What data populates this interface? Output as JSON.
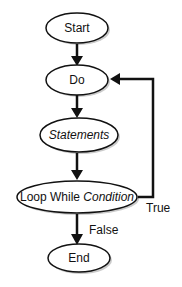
{
  "diagram": {
    "type": "flowchart",
    "nodes": [
      {
        "id": "start",
        "label": "Start",
        "shape": "ellipse"
      },
      {
        "id": "do",
        "label": "Do",
        "shape": "ellipse"
      },
      {
        "id": "statements",
        "label": "Statements",
        "shape": "ellipse",
        "italic": true
      },
      {
        "id": "loop",
        "label_plain": "Loop While ",
        "label_italic": "Condition",
        "shape": "ellipse"
      },
      {
        "id": "end",
        "label": "End",
        "shape": "ellipse"
      }
    ],
    "edges": [
      {
        "from": "start",
        "to": "do",
        "label": ""
      },
      {
        "from": "do",
        "to": "statements",
        "label": ""
      },
      {
        "from": "statements",
        "to": "loop",
        "label": ""
      },
      {
        "from": "loop",
        "to": "end",
        "label": "False"
      },
      {
        "from": "loop",
        "to": "do",
        "label": "True"
      }
    ],
    "colors": {
      "stroke": "#111111",
      "fill": "#ffffff",
      "shadow": "#999999"
    }
  }
}
